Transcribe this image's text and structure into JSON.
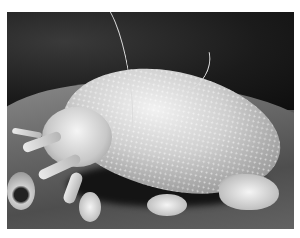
{
  "image": {
    "description": "Scanning electron micrograph of a dust mite on a surface",
    "subject": "dust mite",
    "style": "grayscale SEM photograph"
  }
}
